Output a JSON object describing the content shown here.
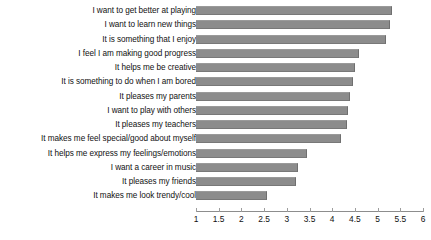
{
  "chart_data": {
    "type": "bar",
    "orientation": "horizontal",
    "title": "",
    "subtitle": "",
    "xlabel": "",
    "ylabel": "",
    "xlim": [
      1,
      6
    ],
    "xticks": [
      1,
      1.5,
      2,
      2.5,
      3,
      3.5,
      4,
      4.5,
      5,
      5.5,
      6
    ],
    "xtick_labels": [
      "1",
      "1.5",
      "2",
      "2.5",
      "3",
      "3.5",
      "4",
      "4.5",
      "5",
      "5.5",
      "6"
    ],
    "grid": false,
    "legend": null,
    "legend_position": "none",
    "bar_color": "#8c8c8c",
    "background_color": "#ffffff",
    "categories": [
      "I want to get better at playing",
      "I want to learn new things",
      "It is something that I enjoy",
      "I feel I am making good progress",
      "It helps me be creative",
      "It is something to do when I am bored",
      "It pleases my parents",
      "I want to play with others",
      "It pleases my teachers",
      "It makes me feel special/good about myself",
      "It helps me express my feelings/emotions",
      "I want a career in music",
      "It pleases my friends",
      "It makes me look trendy/cool"
    ],
    "values": [
      5.32,
      5.27,
      5.19,
      4.6,
      4.5,
      4.45,
      4.4,
      4.35,
      4.33,
      4.2,
      3.45,
      3.25,
      3.2,
      2.56
    ]
  }
}
